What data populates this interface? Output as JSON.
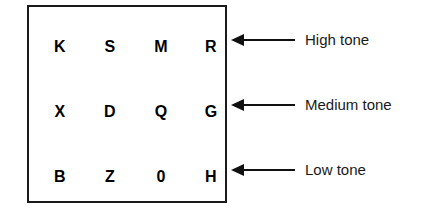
{
  "diagram": {
    "type": "tone-grid",
    "grid": {
      "rows": [
        {
          "id": "high",
          "cells": [
            "K",
            "S",
            "M",
            "R"
          ]
        },
        {
          "id": "medium",
          "cells": [
            "X",
            "D",
            "Q",
            "G"
          ]
        },
        {
          "id": "low",
          "cells": [
            "B",
            "Z",
            "0",
            "H"
          ]
        }
      ]
    },
    "annotations": [
      {
        "id": "high",
        "arrow": "left-arrow-icon",
        "label": "High tone"
      },
      {
        "id": "medium",
        "arrow": "left-arrow-icon",
        "label": "Medium tone"
      },
      {
        "id": "low",
        "arrow": "left-arrow-icon",
        "label": "Low tone"
      }
    ],
    "colors": {
      "background": "#ffffff",
      "box_border": "#1a1a1a",
      "cell_text": "#000000",
      "arrow": "#111111",
      "label_text": "#1a1a1a"
    }
  }
}
